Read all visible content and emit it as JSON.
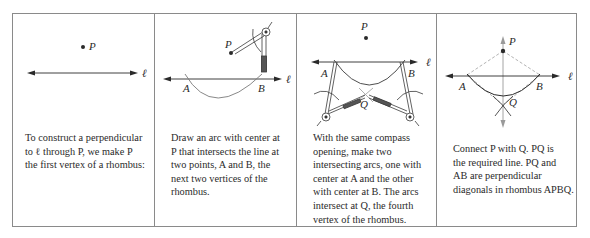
{
  "panels": [
    {
      "id": "step-1",
      "labels": {
        "P": "P",
        "line": "ℓ"
      },
      "caption_lines": [
        "To construct a perpendicular",
        "to ℓ through  P,  we make P",
        "the first vertex of a rhombus:"
      ]
    },
    {
      "id": "step-2",
      "labels": {
        "P": "P",
        "A": "A",
        "B": "B",
        "line": "ℓ"
      },
      "caption_lines": [
        "Draw an arc with center at",
        "P that intersects the line at",
        "two points, A and B, the",
        "next two vertices of the",
        "rhombus."
      ]
    },
    {
      "id": "step-3",
      "labels": {
        "P": "P",
        "A": "A",
        "B": "B",
        "Q": "Q",
        "line": "ℓ"
      },
      "caption_lines": [
        "With the same compass",
        "opening, make two",
        "intersecting arcs, one with",
        "center at  A  and the other",
        "with center at B. The arcs",
        "intersect at  Q, the fourth",
        "vertex of the rhombus."
      ]
    },
    {
      "id": "step-4",
      "labels": {
        "P": "P",
        "A": "A",
        "B": "B",
        "Q": "Q",
        "line": "ℓ"
      },
      "caption_lines": [
        "Connect  P with Q.  PQ is",
        "the required line.  PQ and",
        "AB are perpendicular",
        "diagonals in rhombus APBQ."
      ]
    }
  ],
  "colors": {
    "border": "#8a8a8a",
    "ink": "#2a2a2a",
    "construction": "#9a9a9a"
  }
}
